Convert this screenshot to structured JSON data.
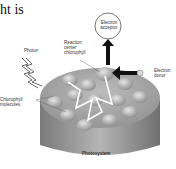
{
  "heading": "ht is",
  "labels": {
    "electron_acceptor": [
      "Electron",
      "acceptor"
    ],
    "reaction_center": [
      "Reaction",
      "center",
      "chlorophyll"
    ],
    "photon": "Photon",
    "electron_donor": [
      "Electron",
      "donor"
    ],
    "chlorophyll_molecules": [
      "Chlorophyll",
      "molecules"
    ],
    "photosystem": "Photosystem"
  },
  "colors": {
    "cylinder_top": "#a9a9a9",
    "cylinder_side": "#8c8c8c",
    "pigment": "#c8c8c8",
    "path": "#ffffff",
    "arrow": "#111111"
  }
}
